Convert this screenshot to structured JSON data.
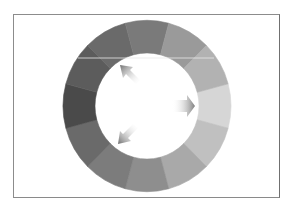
{
  "diagram": {
    "type": "color-wheel",
    "segments": 12,
    "center": [
      147,
      106
    ],
    "outer_radius": 84,
    "inner_radius": 52,
    "segment_colors": [
      "#d6d6d6",
      "#c0c0c0",
      "#a9a9a9",
      "#8e8e8e",
      "#7c7c7c",
      "#6a6a6a",
      "#4a4a4a",
      "#5c5c5c",
      "#6a6a6a",
      "#7a7a7a",
      "#9a9a9a",
      "#b2b2b2"
    ],
    "arrows": [
      {
        "name": "arrow-right",
        "direction": "right",
        "color": "#8a8a8a"
      },
      {
        "name": "arrow-up-left",
        "direction": "up-left",
        "color": "#7a7a7a"
      },
      {
        "name": "arrow-down-left",
        "direction": "down-left",
        "color": "#7a7a7a"
      }
    ]
  }
}
